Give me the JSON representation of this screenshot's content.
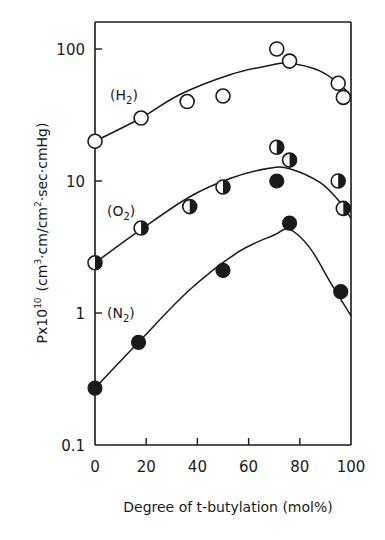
{
  "chart_data": {
    "type": "scatter",
    "title": "",
    "xlabel": "Degree of t-butylation (mol%)",
    "ylabel": "Px10^10 (cm3·cm/cm2·sec·cmHg)",
    "xlim": [
      0,
      100
    ],
    "ylim": [
      0.1,
      200
    ],
    "yscale": "log",
    "x_ticks": [
      0,
      20,
      40,
      60,
      80,
      100
    ],
    "x_tick_labels": [
      "0",
      "20",
      "40",
      "60",
      "80",
      "100"
    ],
    "y_ticks": [
      0.1,
      1,
      10,
      100
    ],
    "y_tick_labels": [
      "0.1",
      "1",
      "10",
      "100"
    ],
    "grid": false,
    "legend": "inline labels",
    "series": [
      {
        "name": "(H2)",
        "marker": "open-circle",
        "points": [
          {
            "x": 0,
            "y": 20
          },
          {
            "x": 18,
            "y": 30
          },
          {
            "x": 36,
            "y": 40
          },
          {
            "x": 50,
            "y": 44
          },
          {
            "x": 71,
            "y": 100
          },
          {
            "x": 76,
            "y": 81
          },
          {
            "x": 95,
            "y": 55
          },
          {
            "x": 97,
            "y": 43
          }
        ],
        "fit_curve": [
          [
            0,
            20
          ],
          [
            18,
            30
          ],
          [
            33,
            45
          ],
          [
            53,
            64
          ],
          [
            68,
            75
          ],
          [
            76,
            78
          ],
          [
            88,
            68
          ],
          [
            96,
            53
          ],
          [
            100,
            44
          ]
        ]
      },
      {
        "name": "(O2)",
        "marker": "half-filled-circle",
        "points": [
          {
            "x": 0,
            "y": 2.4
          },
          {
            "x": 18,
            "y": 4.4
          },
          {
            "x": 37,
            "y": 6.4
          },
          {
            "x": 50,
            "y": 9
          },
          {
            "x": 71,
            "y": 18
          },
          {
            "x": 76,
            "y": 14.4
          },
          {
            "x": 95,
            "y": 10
          },
          {
            "x": 97,
            "y": 6.2
          }
        ],
        "fit_curve": [
          [
            0,
            2.4
          ],
          [
            18,
            4.3
          ],
          [
            37,
            7.6
          ],
          [
            53,
            10.5
          ],
          [
            68,
            12.5
          ],
          [
            76,
            12.4
          ],
          [
            88,
            9.7
          ],
          [
            96,
            6.8
          ],
          [
            100,
            5.2
          ]
        ]
      },
      {
        "name": "(N2)",
        "marker": "filled-circle",
        "points": [
          {
            "x": 0,
            "y": 0.27
          },
          {
            "x": 17,
            "y": 0.6
          },
          {
            "x": 50,
            "y": 2.1
          },
          {
            "x": 71,
            "y": 10
          },
          {
            "x": 76,
            "y": 4.8
          },
          {
            "x": 96,
            "y": 1.45
          }
        ],
        "fit_curve": [
          [
            0,
            0.27
          ],
          [
            18,
            0.63
          ],
          [
            37,
            1.5
          ],
          [
            56,
            2.9
          ],
          [
            70,
            3.9
          ],
          [
            76,
            4.3
          ],
          [
            84,
            3.1
          ],
          [
            92,
            1.7
          ],
          [
            100,
            0.95
          ]
        ]
      }
    ]
  },
  "labels": {
    "h2": "(H",
    "h2_sub": "2",
    "o2": "(O",
    "o2_sub": "2",
    "n2": "(N",
    "n2_sub": "2",
    "close_paren": ")",
    "x_axis_title": "Degree of t-butylation (mol%)",
    "y_axis_prefix": "Px10",
    "y_axis_exp": "10",
    "y_axis_units_a": "(cm",
    "y_axis_units_b": "3",
    "y_axis_units_c": "·cm/cm",
    "y_axis_units_d": "2",
    "y_axis_units_e": "·sec·cmHg)"
  }
}
